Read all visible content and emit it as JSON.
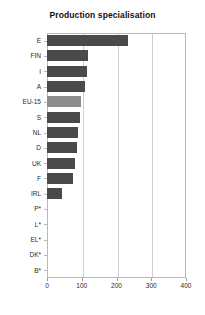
{
  "chart_data": {
    "type": "bar",
    "orientation": "horizontal",
    "title": "Production specialisation",
    "xlabel": "",
    "ylabel": "",
    "xlim": [
      0,
      400
    ],
    "xticks": [
      0,
      100,
      200,
      300,
      400
    ],
    "xtick_labels": [
      "0",
      "100",
      "200",
      "300",
      "400"
    ],
    "grid": "vertical",
    "legend": "none",
    "categories": [
      "E",
      "FIN",
      "I",
      "A",
      "EU-15",
      "S",
      "NL",
      "D",
      "UK",
      "F",
      "IRL",
      "P*",
      "L*",
      "EL*",
      "DK*",
      "B*"
    ],
    "values": [
      233,
      119,
      114,
      110,
      97,
      95,
      90,
      86,
      80,
      75,
      44,
      0,
      0,
      0,
      0,
      0
    ],
    "bar_colors": [
      "#4a4a4a",
      "#4a4a4a",
      "#4a4a4a",
      "#4a4a4a",
      "#8d8d8d",
      "#4a4a4a",
      "#4a4a4a",
      "#4a4a4a",
      "#4a4a4a",
      "#4a4a4a",
      "#4a4a4a",
      "#4a4a4a",
      "#4a4a4a",
      "#4a4a4a",
      "#4a4a4a",
      "#4a4a4a"
    ],
    "highlight_category": "EU-15",
    "colors": {
      "bar": "#4a4a4a",
      "bar_highlight": "#8d8d8d",
      "gridline": "#cfcfcf",
      "axis": "#b9b9b9",
      "text": "#2a2a2a",
      "background": "#ffffff"
    }
  }
}
